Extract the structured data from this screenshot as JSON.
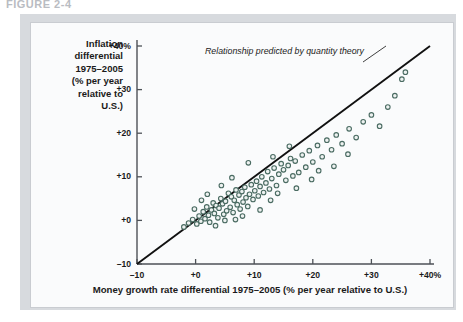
{
  "figure": {
    "header": "FIGURE 2-4"
  },
  "ghost_text": {
    "top_left": "",
    "top_right": ""
  },
  "chart_data": {
    "type": "scatter",
    "title": "",
    "xlabel": "Money growth rate differential 1975–2005 (% per year relative to U.S.)",
    "ylabel": "Inflation differential 1975–2005 (% per year relative to U.S.)",
    "ylabel_lines": [
      "Inflation",
      "differential",
      "1975–2005",
      "(% per year",
      "relative to",
      "U.S.)"
    ],
    "xlim": [
      -10,
      40
    ],
    "ylim": [
      -10,
      40
    ],
    "xticks": [
      -10,
      0,
      10,
      20,
      30,
      40
    ],
    "yticks": [
      -10,
      0,
      10,
      20,
      30,
      40
    ],
    "xticklabels": [
      "–10",
      "+0",
      "+10",
      "+20",
      "+30",
      "+40%"
    ],
    "yticklabels": [
      "–10",
      "+0",
      "+10",
      "+20",
      "+30",
      "+40%"
    ],
    "grid": false,
    "legend": null,
    "marker": {
      "shape": "open-circle",
      "edge_color": "#4a6b62",
      "fill_color": "#eef2f1",
      "size_px": 4.6
    },
    "reference_line": {
      "label": "Relationship predicted by quantity theory",
      "slope": 1,
      "intercept": 0,
      "from": [
        -10,
        -10
      ],
      "to": [
        40,
        40
      ],
      "color": "#111111",
      "width_px": 1.9
    },
    "annotation": {
      "text": "Relationship predicted by quantity theory",
      "x_px": 205,
      "y_px": 52,
      "leader_from_px": [
        363,
        62
      ],
      "leader_to_px": [
        386,
        46
      ]
    },
    "points": [
      [
        -2.0,
        -1.5
      ],
      [
        -1.2,
        -0.6
      ],
      [
        -0.5,
        0.2
      ],
      [
        0.2,
        -0.8
      ],
      [
        0.6,
        1.0
      ],
      [
        0.9,
        -0.2
      ],
      [
        1.3,
        2.0
      ],
      [
        1.6,
        0.4
      ],
      [
        1.9,
        3.1
      ],
      [
        2.2,
        1.2
      ],
      [
        2.4,
        -0.4
      ],
      [
        2.7,
        2.4
      ],
      [
        3.0,
        4.0
      ],
      [
        3.2,
        1.6
      ],
      [
        3.5,
        3.4
      ],
      [
        3.8,
        0.6
      ],
      [
        4.0,
        2.8
      ],
      [
        4.3,
        5.0
      ],
      [
        4.6,
        3.8
      ],
      [
        4.8,
        1.4
      ],
      [
        5.1,
        4.4
      ],
      [
        5.3,
        2.2
      ],
      [
        5.6,
        6.2
      ],
      [
        5.9,
        3.0
      ],
      [
        6.1,
        5.4
      ],
      [
        6.4,
        1.8
      ],
      [
        6.6,
        4.6
      ],
      [
        6.9,
        7.0
      ],
      [
        7.1,
        3.6
      ],
      [
        7.4,
        5.8
      ],
      [
        7.6,
        2.6
      ],
      [
        7.9,
        6.6
      ],
      [
        8.1,
        4.2
      ],
      [
        8.4,
        7.6
      ],
      [
        8.6,
        5.2
      ],
      [
        8.9,
        3.2
      ],
      [
        9.2,
        6.0
      ],
      [
        9.5,
        8.2
      ],
      [
        9.8,
        4.8
      ],
      [
        10.1,
        6.8
      ],
      [
        10.4,
        9.0
      ],
      [
        10.7,
        5.6
      ],
      [
        11.0,
        7.8
      ],
      [
        11.3,
        10.0
      ],
      [
        11.6,
        6.4
      ],
      [
        12.0,
        8.6
      ],
      [
        12.3,
        11.2
      ],
      [
        12.6,
        7.2
      ],
      [
        13.0,
        9.6
      ],
      [
        13.4,
        12.0
      ],
      [
        13.8,
        8.0
      ],
      [
        14.2,
        10.6
      ],
      [
        14.6,
        13.0
      ],
      [
        15.0,
        11.6
      ],
      [
        15.4,
        9.2
      ],
      [
        15.8,
        12.6
      ],
      [
        16.2,
        14.2
      ],
      [
        16.6,
        10.2
      ],
      [
        17.0,
        13.6
      ],
      [
        17.6,
        11.0
      ],
      [
        18.2,
        15.0
      ],
      [
        18.8,
        12.2
      ],
      [
        19.4,
        16.0
      ],
      [
        20.0,
        13.4
      ],
      [
        20.8,
        17.2
      ],
      [
        21.6,
        14.6
      ],
      [
        22.4,
        18.4
      ],
      [
        23.2,
        16.2
      ],
      [
        24.0,
        19.6
      ],
      [
        25.0,
        17.6
      ],
      [
        26.2,
        21.0
      ],
      [
        27.4,
        19.0
      ],
      [
        28.6,
        22.6
      ],
      [
        30.0,
        24.2
      ],
      [
        31.4,
        21.6
      ],
      [
        32.8,
        26.0
      ],
      [
        34.0,
        28.6
      ],
      [
        35.2,
        32.4
      ],
      [
        35.8,
        34.0
      ],
      [
        9.0,
        13.2
      ],
      [
        6.2,
        9.8
      ],
      [
        12.8,
        4.6
      ],
      [
        17.2,
        7.4
      ],
      [
        19.8,
        9.4
      ],
      [
        23.6,
        12.4
      ],
      [
        2.0,
        6.0
      ],
      [
        4.4,
        8.0
      ],
      [
        1.0,
        4.6
      ],
      [
        14.0,
        6.2
      ],
      [
        21.0,
        11.4
      ],
      [
        26.0,
        15.2
      ],
      [
        8.0,
        1.0
      ],
      [
        11.0,
        2.4
      ],
      [
        5.0,
        0.0
      ],
      [
        -0.2,
        2.6
      ],
      [
        3.4,
        -1.2
      ],
      [
        6.8,
        0.2
      ],
      [
        16.0,
        17.0
      ],
      [
        13.2,
        14.6
      ]
    ]
  }
}
